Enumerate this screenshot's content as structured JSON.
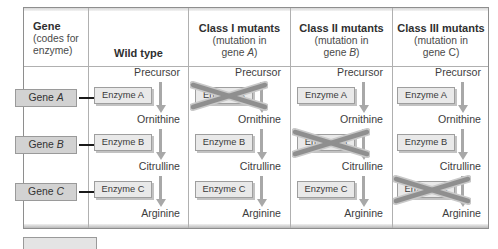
{
  "figure": {
    "kind": "metabolic-pathway-comparison-table",
    "columns": [
      {
        "id": "gene",
        "title": "Gene",
        "subtitle_lines": [
          "(codes for",
          "enzyme)"
        ],
        "align": "left"
      },
      {
        "id": "wild_type",
        "title": "Wild type",
        "subtitle_lines": [],
        "align": "center"
      },
      {
        "id": "class_i",
        "title": "Class I mutants",
        "subtitle_lines": [
          "(mutation in",
          "gene A)"
        ],
        "subtitle_italic_token": "A",
        "align": "center"
      },
      {
        "id": "class_ii",
        "title": "Class II mutants",
        "subtitle_lines": [
          "(mutation in",
          "gene B)"
        ],
        "subtitle_italic_token": "B",
        "align": "center"
      },
      {
        "id": "class_iii",
        "title": "Class III mutants",
        "subtitle_lines": [
          "(mutation in",
          "gene C)"
        ],
        "subtitle_italic_token": "",
        "align": "center"
      }
    ],
    "genes": [
      {
        "label_prefix": "Gene",
        "label_letter": "A"
      },
      {
        "label_prefix": "Gene",
        "label_letter": "B"
      },
      {
        "label_prefix": "Gene",
        "label_letter": "C"
      }
    ],
    "enzymes": [
      "Enzyme A",
      "Enzyme B",
      "Enzyme C"
    ],
    "metabolites": [
      "Precursor",
      "Ornithine",
      "Citrulline",
      "Arginine"
    ],
    "pathway_columns": [
      {
        "id": "wild_type",
        "blocked_enzyme_index": null
      },
      {
        "id": "class_i",
        "blocked_enzyme_index": 0
      },
      {
        "id": "class_ii",
        "blocked_enzyme_index": 1
      },
      {
        "id": "class_iii",
        "blocked_enzyme_index": 2
      }
    ],
    "colors": {
      "frame_border": "#8e8e8e",
      "grid_line": "#b0b0b0",
      "gene_box_fill": "#d2d2d2",
      "enzyme_box_fill": "#e9e9e9",
      "gene_arrow": "#1a1a1a",
      "pathway_arrow": "#a8a8a8",
      "x_mark": "#8f8f8f",
      "text": "#3d3d3d",
      "heading_text": "#2f2f2f",
      "page_background": "#ffffff"
    }
  }
}
